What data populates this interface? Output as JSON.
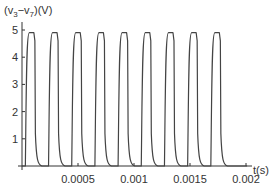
{
  "chart_data": {
    "type": "line",
    "title": "",
    "xlabel": "t(s)",
    "ylabel": "(v3−v7)(V)",
    "ylabel_parts": {
      "prefix": "(v",
      "sub1": "3",
      "mid": "−v",
      "sub2": "7",
      "suffix": ")(V)"
    },
    "xlim": [
      0,
      0.0021
    ],
    "ylim": [
      0,
      5
    ],
    "x_ticks": [
      0.0005,
      0.001,
      0.0015,
      0.002
    ],
    "x_tick_labels": [
      "0.0005",
      "0.001",
      "0.0015",
      "0.002"
    ],
    "y_ticks": [
      1,
      2,
      3,
      4,
      5
    ],
    "y_tick_labels": [
      "1",
      "2",
      "3",
      "4",
      "5"
    ],
    "grid": false,
    "legend": null,
    "series": [
      {
        "name": "v3 - v7",
        "description": "Periodic pulse train oscillating between ~0 V and ~4.9 V, 9 pulses over 0.002 s (period ~0.000207 s)",
        "period_s": 0.000207,
        "high_V": 4.9,
        "low_V": 0,
        "pulse_count": 9,
        "first_rise_s": 3e-05,
        "high_duration_s": 8.5e-05,
        "end_s": 0.00201
      }
    ],
    "color": "#444444"
  }
}
